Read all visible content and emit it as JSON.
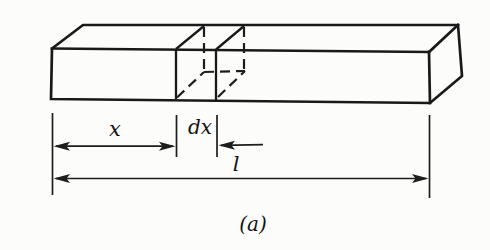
{
  "figure": {
    "type": "diagram",
    "caption": "(a)",
    "labels": {
      "x": "x",
      "dx": "dx",
      "l": "l"
    },
    "colors": {
      "line": "#191919",
      "background": "#fcfcfb"
    }
  }
}
